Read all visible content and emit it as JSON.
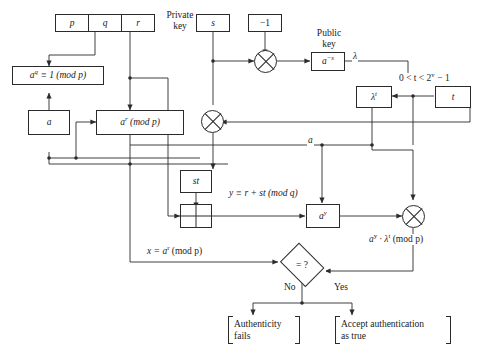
{
  "diagram": {
    "line_color": "#2b2b2b",
    "background": "#ffffff"
  },
  "params": {
    "p": "p",
    "q": "q",
    "r": "r"
  },
  "nodes": {
    "order_condition": "aᵠ ≡ 1 (mod p)",
    "order_condition_base": "a",
    "order_condition_exp": "q",
    "order_condition_rest": " ≡ 1 (mod p)",
    "base_a": "a",
    "commitment_base": "a",
    "commitment_exp": "r",
    "commitment_rest": " (mod p)",
    "private_key_value": "s",
    "minus_one": "−1",
    "public_key_base": "a",
    "public_key_exp": "−s",
    "lambda_t_base": "λ",
    "lambda_t_exp": "t",
    "challenge_t": "t",
    "st": "st",
    "a_y_base": "a",
    "a_y_exp": "y",
    "compare": "= ?"
  },
  "labels": {
    "private_key": "Private\nkey",
    "private_key_line1": "Private",
    "private_key_line2": "key",
    "public_key_line1": "Public",
    "public_key_line2": "key",
    "lambda": "λ",
    "t_range": "0 < t < 2ᵛ − 1",
    "t_range_pre": "0 < t < 2",
    "t_range_exp": "v",
    "t_range_post": " − 1",
    "a_on_bus": "a",
    "y_congruence": "y ≡ r + st (mod q)",
    "x_equals": "x = aʳ (mod p)",
    "x_equals_pre": "x = a",
    "x_equals_exp": "r",
    "x_equals_post": " (mod p)",
    "verify_product": "aʸ · λᵗ (mod p)",
    "verify_pre": "a",
    "verify_exp1": "y",
    "verify_mid": " · λ",
    "verify_exp2": "t",
    "verify_post": " (mod p)",
    "no": "No",
    "yes": "Yes",
    "fail_line1": "Authenticity",
    "fail_line2": "fails",
    "accept_line1": "Accept authentication",
    "accept_line2": "as true"
  }
}
